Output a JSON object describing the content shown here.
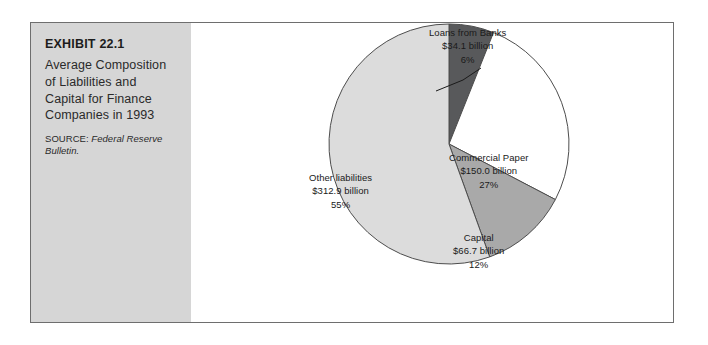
{
  "exhibit": {
    "number": "EXHIBIT 22.1",
    "title": "Average Composition of Liabilities and Capital for Finance Companies in 1993",
    "source_label": "SOURCE:",
    "source_italic": "Federal Reserve Bulletin."
  },
  "chart_data": {
    "type": "pie",
    "title": "Average Composition of Liabilities and Capital for Finance Companies in 1993",
    "unit": "billion dollars",
    "start_angle_deg": 0,
    "direction": "clockwise",
    "legend": "none",
    "labels_inline": true,
    "categories": [
      "Loans from Banks",
      "Commercial Paper",
      "Capital",
      "Other liabilities"
    ],
    "values": [
      34.1,
      150.0,
      66.7,
      312.9
    ],
    "percents": [
      6,
      27,
      12,
      55
    ],
    "colors": [
      "#58595b",
      "#ffffff",
      "#a9a9a9",
      "#dcdcdc"
    ],
    "slices": [
      {
        "name": "Loans from Banks",
        "value": 34.1,
        "value_text": "$34.1 billion",
        "percent": 6,
        "percent_text": "6%",
        "color": "#58595b",
        "label_placement": "outside-callout"
      },
      {
        "name": "Commercial Paper",
        "value": 150.0,
        "value_text": "$150.0 billion",
        "percent": 27,
        "percent_text": "27%",
        "color": "#ffffff",
        "label_placement": "inside"
      },
      {
        "name": "Capital",
        "value": 66.7,
        "value_text": "$66.7 billion",
        "percent": 12,
        "percent_text": "12%",
        "color": "#a9a9a9",
        "label_placement": "inside"
      },
      {
        "name": "Other liabilities",
        "value": 312.9,
        "value_text": "$312.9 billion",
        "percent": 55,
        "percent_text": "55%",
        "color": "#dcdcdc",
        "label_placement": "inside"
      }
    ]
  },
  "style": {
    "panel_background": "#d6d6d6",
    "frame_border": "#6e6e6e",
    "stroke": "#4d4d4d"
  }
}
